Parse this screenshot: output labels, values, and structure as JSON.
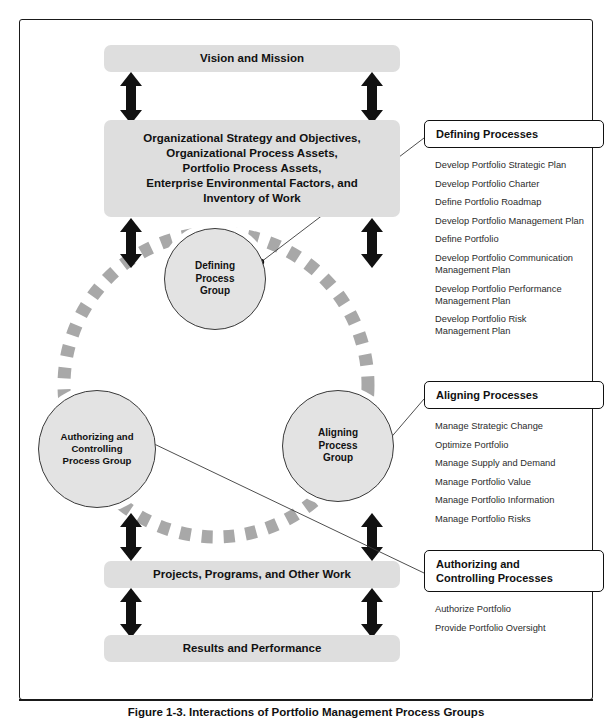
{
  "figure": {
    "caption": "Figure 1-3. Interactions of Portfolio Management Process Groups"
  },
  "flow_boxes": [
    {
      "id": "vision",
      "label": "Vision and Mission"
    },
    {
      "id": "strategy",
      "label": "Organizational Strategy and Objectives,\nOrganizational Process Assets,\nPortfolio Process Assets,\nEnterprise Environmental Factors, and\nInventory of Work"
    },
    {
      "id": "projects",
      "label": "Projects, Programs, and Other Work"
    },
    {
      "id": "results",
      "label": "Results and Performance"
    }
  ],
  "process_groups": [
    {
      "id": "defining",
      "label": "Defining\nProcess\nGroup"
    },
    {
      "id": "authctrl",
      "label": "Authorizing and\nControlling\nProcess Group"
    },
    {
      "id": "aligning",
      "label": "Aligning\nProcess\nGroup"
    }
  ],
  "panels": [
    {
      "id": "defining",
      "title": "Defining Processes",
      "processes": [
        "Develop Portfolio Strategic Plan",
        "Develop Portfolio Charter",
        "Define Portfolio Roadmap",
        "Develop Portfolio Management Plan",
        "Define Portfolio",
        "Develop Portfolio Communication\nManagement Plan",
        "Develop Portfolio Performance\nManagement Plan",
        "Develop Portfolio Risk\nManagement Plan"
      ]
    },
    {
      "id": "aligning",
      "title": "Aligning Processes",
      "processes": [
        "Manage Strategic Change",
        "Optimize Portfolio",
        "Manage Supply and Demand",
        "Manage Portfolio Value",
        "Manage Portfolio Information",
        "Manage Portfolio Risks"
      ]
    },
    {
      "id": "authctrl",
      "title": "Authorizing and\nControlling Processes",
      "processes": [
        "Authorize Portfolio",
        "Provide Portfolio Oversight"
      ]
    }
  ],
  "colors": {
    "box_fill": "#dedede",
    "circle_fill": "#e3e3e3",
    "arc_dash": "#a8a8a8",
    "arrow": "#111111",
    "frame": "#1a1a1a",
    "connector": "#3a3a3a"
  }
}
